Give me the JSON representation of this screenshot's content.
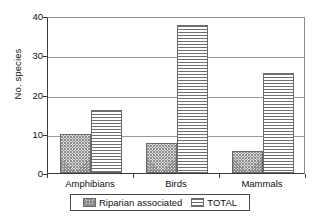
{
  "chart_data": {
    "type": "bar",
    "title": "",
    "subtitle": "",
    "xlabel": "",
    "ylabel": "No. species",
    "categories": [
      "Amphibians",
      "Birds",
      "Mammals"
    ],
    "series": [
      {
        "name": "Riparian associated",
        "values": [
          10,
          7.7,
          5.6
        ],
        "pattern": "checkerboard"
      },
      {
        "name": "TOTAL",
        "values": [
          16,
          37.7,
          25.5
        ],
        "pattern": "horizontal-stripes"
      }
    ],
    "ylim": [
      0,
      40
    ],
    "yticks": [
      0,
      10,
      20,
      30,
      40
    ],
    "ytick_labels": [
      "0",
      "10",
      "20",
      "30",
      "40"
    ],
    "grid": "horizontal",
    "legend_position": "bottom",
    "legend_entries": [
      "Riparian associated",
      "TOTAL"
    ],
    "annotations": []
  },
  "colors": {
    "axis": "#3a3a3a",
    "grid": "#9a9a9a",
    "bar_outline": "#6a6a6a",
    "hatch": "#6f6f6f",
    "background": "#ffffff",
    "text": "#111111"
  }
}
